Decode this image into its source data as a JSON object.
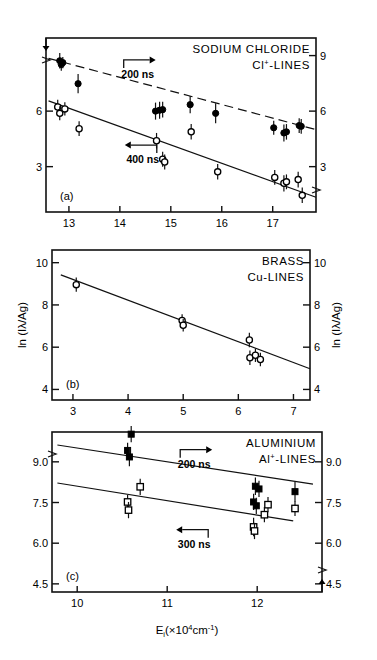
{
  "figure": {
    "width": 377,
    "height": 660,
    "background": "#ffffff",
    "ink": "#000000",
    "xlabel_main": "E",
    "xlabel_sub": "i",
    "xlabel_rest": "(×10",
    "xlabel_exp": "4",
    "xlabel_unit": "cm",
    "xlabel_unit_exp": "-1",
    "xlabel_close": ")"
  },
  "chart_data": [
    {
      "type": "scatter",
      "panel": "(a)",
      "title": "SODIUM CHLORIDE",
      "subtitle_pre": "Cl",
      "subtitle_sup": "+",
      "subtitle_post": "-LINES",
      "xlabel": "",
      "ylabel": "",
      "xlim": [
        12.55,
        17.85
      ],
      "ylim": [
        0.55,
        9.95
      ],
      "xticks": [
        13,
        14,
        15,
        16,
        17
      ],
      "yticks_left": [
        6,
        3
      ],
      "yticks_right": [
        9,
        6,
        3
      ],
      "grid": false,
      "legend": "none",
      "axis_break_left": true,
      "axis_break_right": true,
      "annotations": [
        {
          "text": "200 ns",
          "x": 14.35,
          "y": 8.55,
          "arrow": "right"
        },
        {
          "text": "400 ns",
          "x": 14.45,
          "y": 3.95,
          "arrow": "left"
        }
      ],
      "series": [
        {
          "name": "200 ns",
          "marker": "filled-circle",
          "fit_line": {
            "x": [
              12.6,
              17.85
            ],
            "y": [
              8.85,
              5.0
            ],
            "dashed": true
          },
          "points": [
            {
              "x": 12.82,
              "y": 8.72,
              "err": 0.42
            },
            {
              "x": 12.85,
              "y": 8.52,
              "err": 0.34
            },
            {
              "x": 12.88,
              "y": 8.62,
              "err": 0.3
            },
            {
              "x": 13.18,
              "y": 7.48,
              "err": 0.52
            },
            {
              "x": 14.7,
              "y": 6.0,
              "err": 0.46
            },
            {
              "x": 14.78,
              "y": 6.05,
              "err": 0.46
            },
            {
              "x": 14.84,
              "y": 6.08,
              "err": 0.42
            },
            {
              "x": 15.38,
              "y": 6.35,
              "err": 0.46
            },
            {
              "x": 15.88,
              "y": 5.88,
              "err": 0.54
            },
            {
              "x": 17.02,
              "y": 5.1,
              "err": 0.38
            },
            {
              "x": 17.22,
              "y": 4.82,
              "err": 0.46
            },
            {
              "x": 17.27,
              "y": 4.88,
              "err": 0.42
            },
            {
              "x": 17.52,
              "y": 5.22,
              "err": 0.4
            },
            {
              "x": 17.56,
              "y": 5.18,
              "err": 0.4
            }
          ]
        },
        {
          "name": "400 ns",
          "marker": "open-circle",
          "fit_line": {
            "x": [
              12.6,
              17.85
            ],
            "y": [
              6.55,
              1.35
            ],
            "dashed": false
          },
          "points": [
            {
              "x": 12.78,
              "y": 6.22,
              "err": 0.4
            },
            {
              "x": 12.82,
              "y": 5.88,
              "err": 0.38
            },
            {
              "x": 12.92,
              "y": 6.12,
              "err": 0.36
            },
            {
              "x": 13.2,
              "y": 5.05,
              "err": 0.4
            },
            {
              "x": 14.72,
              "y": 4.4,
              "err": 0.42
            },
            {
              "x": 14.84,
              "y": 3.4,
              "err": 0.4
            },
            {
              "x": 14.88,
              "y": 3.25,
              "err": 0.4
            },
            {
              "x": 15.4,
              "y": 4.88,
              "err": 0.42
            },
            {
              "x": 15.92,
              "y": 2.72,
              "err": 0.42
            },
            {
              "x": 17.04,
              "y": 2.42,
              "err": 0.4
            },
            {
              "x": 17.22,
              "y": 2.1,
              "err": 0.44
            },
            {
              "x": 17.27,
              "y": 2.18,
              "err": 0.4
            },
            {
              "x": 17.5,
              "y": 2.3,
              "err": 0.42
            },
            {
              "x": 17.58,
              "y": 1.45,
              "err": 0.42
            }
          ]
        }
      ]
    },
    {
      "type": "scatter",
      "panel": "(b)",
      "title": "BRASS",
      "subtitle_pre": "Cu",
      "subtitle_sup": "",
      "subtitle_post": "-LINES",
      "xlabel": "",
      "ylabel": "ln (Iλ/Ag)",
      "ylabel_right": "ln (Iλ/Ag)",
      "xlim": [
        2.62,
        7.3
      ],
      "ylim": [
        3.5,
        10.6
      ],
      "xticks": [
        3,
        4,
        5,
        6,
        7
      ],
      "yticks_left": [
        10,
        8,
        6,
        4
      ],
      "yticks_right": [
        10,
        8,
        6,
        4
      ],
      "grid": false,
      "legend": "none",
      "annotations": [],
      "series": [
        {
          "name": "Cu-LINES",
          "marker": "open-circle",
          "fit_line": {
            "x": [
              2.78,
              7.3
            ],
            "y": [
              9.42,
              4.98
            ],
            "dashed": false
          },
          "points": [
            {
              "x": 3.06,
              "y": 8.96,
              "err": 0.34
            },
            {
              "x": 4.98,
              "y": 7.26,
              "err": 0.3
            },
            {
              "x": 5.0,
              "y": 7.04,
              "err": 0.3
            },
            {
              "x": 6.2,
              "y": 6.34,
              "err": 0.34
            },
            {
              "x": 6.21,
              "y": 5.5,
              "err": 0.34
            },
            {
              "x": 6.31,
              "y": 5.62,
              "err": 0.32
            },
            {
              "x": 6.4,
              "y": 5.42,
              "err": 0.32
            }
          ]
        }
      ]
    },
    {
      "type": "scatter",
      "panel": "(c)",
      "title": "ALUMINIUM",
      "subtitle_pre": "Al",
      "subtitle_sup": "+",
      "subtitle_post": "-LINES",
      "xlabel": "E_i (×10^4 cm^-1)",
      "ylabel": "",
      "xlim": [
        9.72,
        12.72
      ],
      "ylim": [
        4.2,
        10.1
      ],
      "xticks": [
        10,
        11,
        12
      ],
      "yticks_left": [
        9.0,
        7.5,
        6.0,
        4.5
      ],
      "yticks_right": [
        9.0,
        7.5,
        6.0,
        4.5
      ],
      "grid": false,
      "legend": "none",
      "axis_break_left": true,
      "axis_break_right": true,
      "annotations": [
        {
          "text": "200 ns",
          "x": 11.3,
          "y": 9.3,
          "arrow": "right"
        },
        {
          "text": "300 ns",
          "x": 11.3,
          "y": 6.35,
          "arrow": "left"
        }
      ],
      "series": [
        {
          "name": "200 ns",
          "marker": "filled-square",
          "fit_line": {
            "x": [
              9.78,
              12.62
            ],
            "y": [
              9.62,
              8.18
            ],
            "dashed": false
          },
          "points": [
            {
              "x": 10.6,
              "y": 10.02,
              "err": 0.3
            },
            {
              "x": 10.56,
              "y": 9.42,
              "err": 0.28
            },
            {
              "x": 10.58,
              "y": 9.18,
              "err": 0.34
            },
            {
              "x": 11.98,
              "y": 8.1,
              "err": 0.32
            },
            {
              "x": 12.02,
              "y": 8.0,
              "err": 0.3
            },
            {
              "x": 11.96,
              "y": 7.52,
              "err": 0.3
            },
            {
              "x": 11.99,
              "y": 7.38,
              "err": 0.3
            },
            {
              "x": 12.42,
              "y": 7.9,
              "err": 0.36
            }
          ]
        },
        {
          "name": "300 ns",
          "marker": "open-square",
          "fit_line": {
            "x": [
              9.78,
              12.4
            ],
            "y": [
              8.22,
              6.82
            ],
            "dashed": false
          },
          "points": [
            {
              "x": 10.56,
              "y": 7.52,
              "err": 0.26
            },
            {
              "x": 10.57,
              "y": 7.22,
              "err": 0.3
            },
            {
              "x": 10.7,
              "y": 8.08,
              "err": 0.3
            },
            {
              "x": 11.96,
              "y": 6.6,
              "err": 0.34
            },
            {
              "x": 11.97,
              "y": 6.45,
              "err": 0.3
            },
            {
              "x": 12.08,
              "y": 7.05,
              "err": 0.28
            },
            {
              "x": 12.12,
              "y": 7.42,
              "err": 0.28
            },
            {
              "x": 12.42,
              "y": 7.28,
              "err": 0.28
            }
          ]
        }
      ]
    }
  ]
}
